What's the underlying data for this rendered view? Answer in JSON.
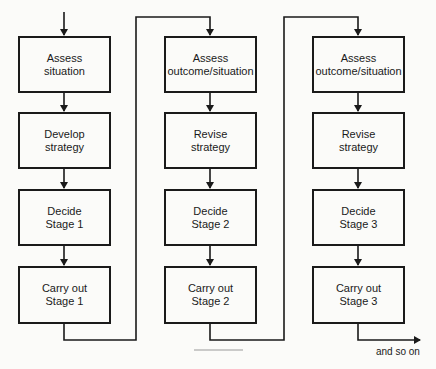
{
  "diagram": {
    "type": "flowchart",
    "columns": [
      {
        "stage": 1,
        "boxes": [
          {
            "label": "Assess\nsituation"
          },
          {
            "label": "Develop\nstrategy"
          },
          {
            "label": "Decide\nStage 1"
          },
          {
            "label": "Carry out\nStage 1"
          }
        ]
      },
      {
        "stage": 2,
        "boxes": [
          {
            "label": "Assess\noutcome/situation"
          },
          {
            "label": "Revise\nstrategy"
          },
          {
            "label": "Decide\nStage 2"
          },
          {
            "label": "Carry out\nStage 2"
          }
        ]
      },
      {
        "stage": 3,
        "boxes": [
          {
            "label": "Assess\noutcome/situation"
          },
          {
            "label": "Revise\nstrategy"
          },
          {
            "label": "Decide\nStage 3"
          },
          {
            "label": "Carry out\nStage 3"
          }
        ]
      }
    ],
    "continuation_label": "and so on",
    "colors": {
      "line": "#1a1a1a",
      "background": "#fbfbf9",
      "rule": "#9a9a9a"
    }
  }
}
